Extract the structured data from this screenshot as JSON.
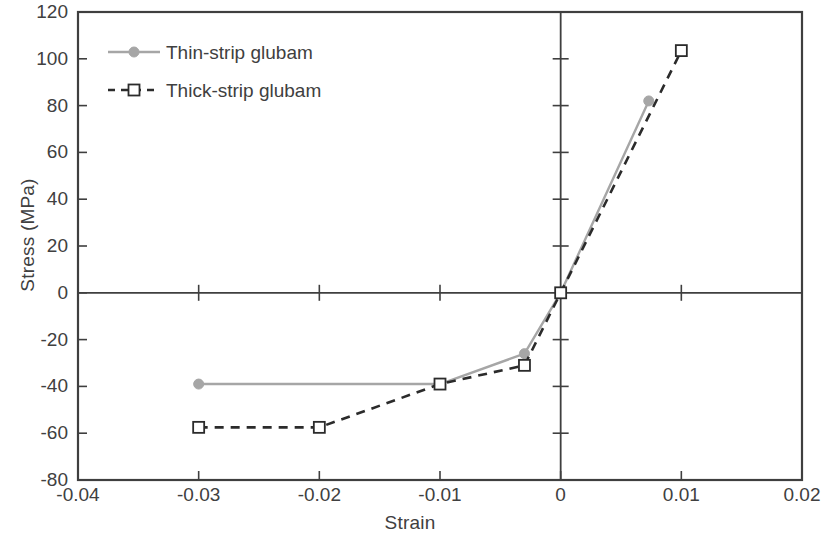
{
  "chart_data": {
    "type": "line",
    "title": "",
    "xlabel": "Strain",
    "ylabel": "Stress (MPa)",
    "xlim": [
      -0.04,
      0.02
    ],
    "ylim": [
      -80,
      120
    ],
    "xticks": [
      -0.04,
      -0.03,
      -0.02,
      -0.01,
      0,
      0.01,
      0.02
    ],
    "xtick_labels": [
      "-0.04",
      "-0.03",
      "-0.02",
      "-0.01",
      "0",
      "0.01",
      "0.02"
    ],
    "yticks": [
      -80,
      -60,
      -40,
      -20,
      0,
      20,
      40,
      60,
      80,
      100,
      120
    ],
    "ytick_labels": [
      "-80",
      "-60",
      "-40",
      "-20",
      "0",
      "20",
      "40",
      "60",
      "80",
      "100",
      "120"
    ],
    "grid": false,
    "legend_position": "upper-left-inside",
    "series": [
      {
        "name": "Thin-strip glubam",
        "color": "#a6a6a6",
        "linestyle": "solid",
        "marker": "filled-circle",
        "x": [
          -0.03,
          -0.01,
          -0.003,
          0,
          0.0073
        ],
        "y": [
          -39,
          -39,
          -26,
          0,
          82
        ]
      },
      {
        "name": "Thick-strip glubam",
        "color": "#2b2b2b",
        "linestyle": "dashed",
        "marker": "open-square",
        "x": [
          -0.03,
          -0.02,
          -0.01,
          -0.003,
          0,
          0.01
        ],
        "y": [
          -57.5,
          -57.5,
          -39,
          -31,
          0,
          103.5
        ]
      }
    ]
  },
  "legend": {
    "items": [
      {
        "label": "Thin-strip glubam"
      },
      {
        "label": "Thick-strip glubam"
      }
    ]
  },
  "axes": {
    "x_title": "Strain",
    "y_title": "Stress (MPa)"
  },
  "colors": {
    "thin_strip": "#a6a6a6",
    "thick_strip": "#2b2b2b",
    "axis": "#3f3f3f",
    "text": "#404040",
    "background": "#ffffff"
  }
}
